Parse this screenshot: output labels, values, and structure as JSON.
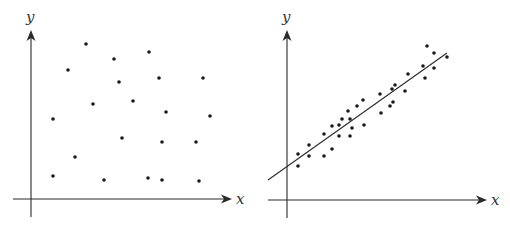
{
  "chart_data": [
    {
      "type": "scatter",
      "title": "",
      "xlabel": "x",
      "ylabel": "y",
      "grid": false,
      "legend": null,
      "description": "No correlation: randomly scattered points",
      "points_px": [
        [
          86,
          44
        ],
        [
          68,
          70
        ],
        [
          114,
          59
        ],
        [
          149,
          52
        ],
        [
          119,
          82
        ],
        [
          159,
          78
        ],
        [
          203,
          78
        ],
        [
          93,
          104
        ],
        [
          133,
          101
        ],
        [
          166,
          112
        ],
        [
          210,
          116
        ],
        [
          53,
          119
        ],
        [
          122,
          138
        ],
        [
          162,
          142
        ],
        [
          196,
          142
        ],
        [
          75,
          157
        ],
        [
          53,
          176
        ],
        [
          104,
          180
        ],
        [
          148,
          178
        ],
        [
          162,
          180
        ],
        [
          199,
          181
        ]
      ],
      "axes_px": {
        "origin": [
          31,
          199
        ],
        "x_end": 232,
        "x_start": 13,
        "y_end": 30,
        "y_start": 217
      }
    },
    {
      "type": "scatter",
      "title": "",
      "xlabel": "x",
      "ylabel": "y",
      "grid": false,
      "legend": null,
      "description": "Strong positive linear correlation with fitted regression line",
      "points_px": [
        [
          427,
          46
        ],
        [
          434,
          53
        ],
        [
          447,
          57
        ],
        [
          423,
          66
        ],
        [
          408,
          74
        ],
        [
          434,
          68
        ],
        [
          425,
          78
        ],
        [
          395,
          85
        ],
        [
          392,
          89
        ],
        [
          405,
          91
        ],
        [
          380,
          94
        ],
        [
          363,
          100
        ],
        [
          357,
          106
        ],
        [
          393,
          102
        ],
        [
          390,
          106
        ],
        [
          348,
          111
        ],
        [
          342,
          119
        ],
        [
          350,
          119
        ],
        [
          381,
          113
        ],
        [
          339,
          125
        ],
        [
          332,
          126
        ],
        [
          352,
          128
        ],
        [
          364,
          125
        ],
        [
          324,
          134
        ],
        [
          339,
          136
        ],
        [
          350,
          136
        ],
        [
          309,
          145
        ],
        [
          332,
          149
        ],
        [
          298,
          154
        ],
        [
          309,
          156
        ],
        [
          324,
          156
        ],
        [
          298,
          166
        ]
      ],
      "fit_line_px": [
        [
          268,
          180
        ],
        [
          447,
          53
        ]
      ],
      "axes_px": {
        "origin": [
          287,
          200
        ],
        "x_end": 487,
        "x_start": 268,
        "y_end": 30,
        "y_start": 218
      }
    }
  ],
  "labels": {
    "left_x": "x",
    "left_y": "y",
    "right_x": "x",
    "right_y": "y"
  }
}
